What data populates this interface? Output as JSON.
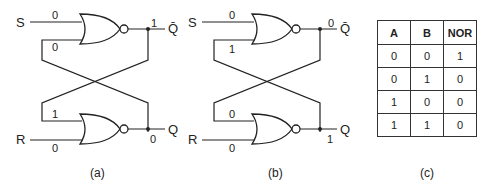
{
  "circuits": [
    {
      "id": "a",
      "caption": "(a)",
      "inputs": {
        "S": "S",
        "R": "R"
      },
      "outputs": {
        "Qbar": "Q̄",
        "Q": "Q"
      },
      "values": {
        "S_in": "0",
        "top_feedback_in": "0",
        "top_out": "1",
        "bottom_feedback_in": "1",
        "R_in": "0",
        "bottom_out": "0"
      }
    },
    {
      "id": "b",
      "caption": "(b)",
      "inputs": {
        "S": "S",
        "R": "R"
      },
      "outputs": {
        "Qbar": "Q̄",
        "Q": "Q"
      },
      "values": {
        "S_in": "0",
        "top_feedback_in": "1",
        "top_out": "0",
        "bottom_feedback_in": "0",
        "R_in": "0",
        "bottom_out": "1"
      }
    }
  ],
  "truth_table": {
    "caption": "(c)",
    "headers": [
      "A",
      "B",
      "NOR"
    ],
    "rows": [
      [
        "0",
        "0",
        "1"
      ],
      [
        "0",
        "1",
        "0"
      ],
      [
        "1",
        "0",
        "0"
      ],
      [
        "1",
        "1",
        "0"
      ]
    ]
  },
  "colors": {
    "line": "#222222",
    "background": "#ffffff"
  }
}
